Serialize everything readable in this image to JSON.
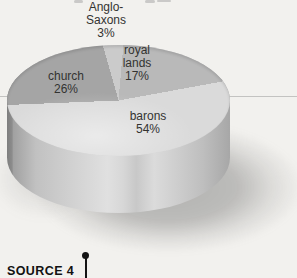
{
  "chart_data": {
    "type": "pie",
    "title": "",
    "unit": "%",
    "legend": "none",
    "label_style": "on-slice",
    "projection": "3d-elliptical",
    "start_offset_deg": 5,
    "squash_ratio": 2.0,
    "slices": [
      {
        "label": "royal lands",
        "value": 17,
        "color": "#b9b9b9"
      },
      {
        "label": "barons",
        "value": 54,
        "color": "#dadada"
      },
      {
        "label": "church",
        "value": 26,
        "color": "#a5a5a5"
      },
      {
        "label": "Anglo-Saxons",
        "value": 3,
        "color": "#cbcbcb"
      }
    ]
  },
  "labels": {
    "anglo": {
      "line1": "Anglo-",
      "line2": "Saxons",
      "pct": "3%"
    },
    "royal": {
      "line1": "royal",
      "line2": "lands",
      "pct": "17%"
    },
    "church": {
      "line1": "church",
      "pct": "26%"
    },
    "barons": {
      "line1": "barons",
      "pct": "54%"
    }
  },
  "source": {
    "label": "SOURCE 4"
  }
}
